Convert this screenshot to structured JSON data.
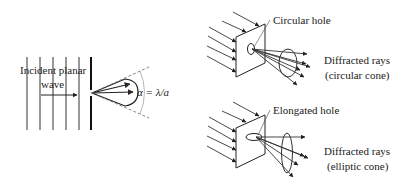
{
  "figure": {
    "left_panel": {
      "incident_label_line1": "Incident planar",
      "incident_label_line2": "wave",
      "angle_label": "α = λ/a"
    },
    "top_right_panel": {
      "hole_label": "Circular hole",
      "rays_label_line1": "Diffracted rays",
      "rays_label_line2": "(circular cone)"
    },
    "bottom_right_panel": {
      "hole_label": "Elongated hole",
      "rays_label_line1": "Diffracted rays",
      "rays_label_line2": "(elliptic cone)"
    },
    "colors": {
      "ink": "#222222",
      "light_ink": "#666666",
      "background": "#ffffff"
    }
  }
}
